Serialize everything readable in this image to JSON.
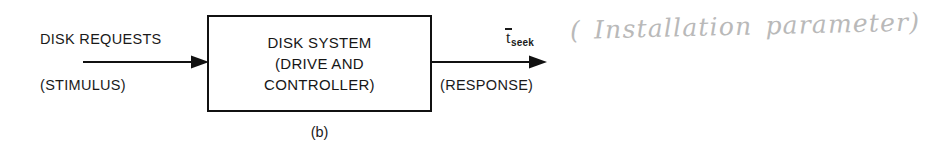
{
  "figure": {
    "caption": "(b)",
    "background_color": "#ffffff",
    "ink_color": "#1a1a1a",
    "pencil_color": "#b9b9b9"
  },
  "system_block": {
    "lines": [
      "DISK SYSTEM",
      "(DRIVE AND",
      "CONTROLLER)"
    ]
  },
  "input_flow": {
    "title": "DISK REQUESTS",
    "subtitle": "(STIMULUS)",
    "arrow_icon": "arrow-right-icon"
  },
  "output_flow": {
    "symbol_base": "t",
    "symbol_subscript": "seek",
    "subtitle": "(RESPONSE)",
    "arrow_icon": "arrow-right-icon"
  },
  "annotation": {
    "handwritten_note": "( Installation parameter)"
  }
}
